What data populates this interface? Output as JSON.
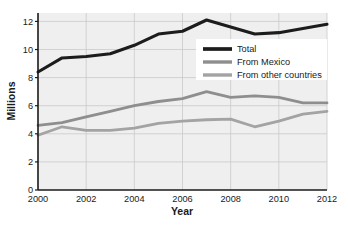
{
  "chart_data": {
    "type": "line",
    "title": "",
    "xlabel": "Year",
    "ylabel": "Millions",
    "x": [
      2000,
      2001,
      2002,
      2003,
      2004,
      2005,
      2006,
      2007,
      2008,
      2009,
      2010,
      2011,
      2012
    ],
    "xlim": [
      2000,
      2012
    ],
    "ylim": [
      0,
      12.6
    ],
    "xticks": [
      2000,
      2002,
      2004,
      2006,
      2008,
      2010,
      2012
    ],
    "xtick_labels": [
      "2000",
      "2002",
      "2004",
      "2006",
      "2008",
      "2010",
      "2012"
    ],
    "yticks": [
      0,
      2,
      4,
      6,
      8,
      10,
      12
    ],
    "ytick_labels": [
      "0",
      "2",
      "4",
      "6",
      "8",
      "10",
      "12"
    ],
    "grid": true,
    "grid_color": "#c9c9c9",
    "plot_background": "#efefef",
    "legend_position": "center-right",
    "series": [
      {
        "name": "Total",
        "color": "#1c1c1c",
        "width": 3.1,
        "values": [
          8.4,
          9.4,
          9.5,
          9.7,
          10.3,
          11.1,
          11.3,
          12.1,
          11.6,
          11.1,
          11.2,
          11.5,
          11.8
        ]
      },
      {
        "name": "From Mexico",
        "color": "#8e8e8e",
        "width": 2.8,
        "values": [
          4.6,
          4.8,
          5.2,
          5.6,
          6.0,
          6.3,
          6.5,
          7.0,
          6.6,
          6.7,
          6.6,
          6.2,
          6.2
        ]
      },
      {
        "name": "From other countries",
        "color": "#a3a3a3",
        "width": 2.8,
        "values": [
          3.9,
          4.5,
          4.25,
          4.25,
          4.4,
          4.75,
          4.9,
          5.0,
          5.05,
          4.5,
          4.9,
          5.4,
          5.6
        ]
      }
    ]
  },
  "legend": {
    "items": [
      {
        "label": "Total"
      },
      {
        "label": "From Mexico"
      },
      {
        "label": "From other countries"
      }
    ]
  },
  "axes": {
    "x_title": "Year",
    "y_title": "Millions"
  }
}
